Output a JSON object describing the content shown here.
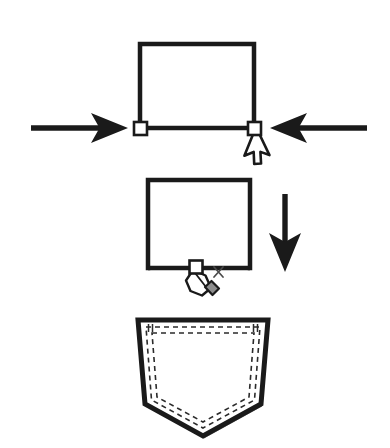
{
  "canvas": {
    "width": 390,
    "height": 448,
    "background": "#ffffff",
    "ink": "#1a1a1a",
    "fill": "#ffffff",
    "stitch": "#2b2b2b",
    "shadow": "#6e6e6e",
    "title": "Pocket shaping instructional diagram"
  },
  "steps": [
    {
      "id": "step-1",
      "name": "narrow-bottom-edge",
      "shape": {
        "type": "rectangle",
        "x": 138,
        "y": 42,
        "width": 118,
        "height": 86,
        "stroke_width": 4
      },
      "handles": [
        {
          "name": "handle-bottom-left",
          "cx": 140,
          "cy": 128,
          "size": 13,
          "state": "selected"
        },
        {
          "name": "handle-bottom-right",
          "cx": 254,
          "cy": 128,
          "size": 13,
          "state": "selected"
        }
      ],
      "arrows": [
        {
          "name": "arrow-push-left",
          "direction": "right",
          "x1": 30,
          "y1": 128,
          "x2": 128,
          "y2": 128
        },
        {
          "name": "arrow-push-right",
          "direction": "left",
          "x1": 368,
          "y1": 128,
          "x2": 268,
          "y2": 128
        }
      ],
      "cursor": {
        "name": "mouse-pointer-cursor",
        "x": 256,
        "y": 128,
        "angle": 28
      }
    },
    {
      "id": "step-2",
      "name": "add-bottom-center-point",
      "shape": {
        "type": "rectangle",
        "x": 146,
        "y": 178,
        "width": 104,
        "height": 92,
        "stroke_width": 4
      },
      "handles": [
        {
          "name": "handle-bottom-center",
          "cx": 196,
          "cy": 267,
          "size": 13,
          "state": "new"
        }
      ],
      "arrows": [
        {
          "name": "arrow-proceed-down",
          "direction": "down",
          "x1": 285,
          "y1": 192,
          "x2": 285,
          "y2": 272
        }
      ],
      "cursor": {
        "name": "pen-tool-cursor",
        "x": 196,
        "y": 268,
        "badge": "×"
      }
    },
    {
      "id": "step-3",
      "name": "finished-pocket",
      "shape": {
        "type": "pocket",
        "top_y": 320,
        "left_x": 138,
        "right_x": 268,
        "hip_y": 404,
        "point_x": 203,
        "point_y": 436,
        "stroke_width": 4
      },
      "stitching": {
        "name": "topstitch-dashed-lines",
        "rows": 2,
        "dash": "5 4",
        "inset_outer": 7,
        "inset_inner": 12
      }
    }
  ],
  "legend": {
    "step_1_label": "",
    "step_2_label": "",
    "step_3_label": ""
  }
}
